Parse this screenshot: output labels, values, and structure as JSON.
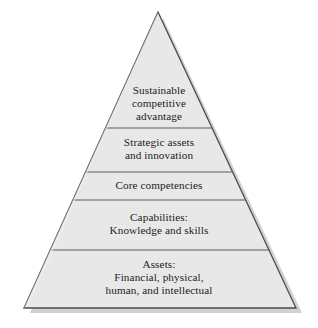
{
  "diagram": {
    "type": "pyramid",
    "tier_count": 5,
    "colors": {
      "fill": "#e8e8e8",
      "stroke": "#4a4a4a",
      "divider": "#5a5a5a",
      "shadow": "#c9c9c9",
      "text": "#1c1c1c",
      "background": "#ffffff"
    },
    "geometry": {
      "apex_x": 158,
      "apex_y": 12,
      "base_left_x": 24,
      "base_right_x": 296,
      "base_y": 308,
      "divider_y": [
        128,
        172,
        200,
        250
      ]
    },
    "tiers": [
      {
        "index": 1,
        "position": "top",
        "name": "sustainable-competitive-advantage",
        "lines": [
          "Sustainable",
          "competitive",
          "advantage"
        ]
      },
      {
        "index": 2,
        "position": "second",
        "name": "strategic-assets-and-innovation",
        "lines": [
          "Strategic assets",
          "and innovation"
        ]
      },
      {
        "index": 3,
        "position": "middle",
        "name": "core-competencies",
        "lines": [
          "Core competencies"
        ]
      },
      {
        "index": 4,
        "position": "fourth",
        "name": "capabilities-knowledge-and-skills",
        "lines": [
          "Capabilities:",
          "Knowledge and skills"
        ]
      },
      {
        "index": 5,
        "position": "base",
        "name": "assets-financial-physical-human-intellectual",
        "lines": [
          "Assets:",
          "Financial, physical,",
          "human, and intellectual"
        ]
      }
    ]
  }
}
